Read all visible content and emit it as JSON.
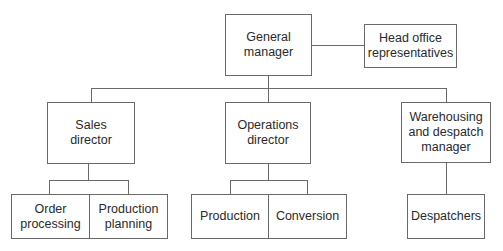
{
  "diagram": {
    "type": "organization-chart",
    "root": {
      "label": "General\nmanager",
      "side": {
        "label": "Head office\nrepresentatives"
      },
      "children": [
        {
          "label": "Sales\ndirector",
          "children": [
            {
              "label": "Order\nprocessing"
            },
            {
              "label": "Production\nplanning"
            }
          ]
        },
        {
          "label": "Operations\ndirector",
          "children": [
            {
              "label": "Production"
            },
            {
              "label": "Conversion"
            }
          ]
        },
        {
          "label": "Warehousing\nand despatch\nmanager",
          "children": [
            {
              "label": "Despatchers"
            }
          ]
        }
      ]
    }
  }
}
